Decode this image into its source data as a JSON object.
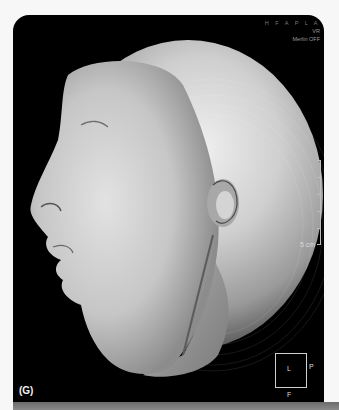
{
  "figure": {
    "panel_label": "(G)"
  },
  "overlay": {
    "top_right_line1": "H F A P L A",
    "top_right_line2": "VR",
    "top_right_line3": "Merlin OFF"
  },
  "scale": {
    "label": "5 cm"
  },
  "orientation": {
    "center": "L",
    "right": "P",
    "bottom": "F"
  },
  "colors": {
    "background": "#000000",
    "surface": "#d9d9d9",
    "page": "#f7f7f7"
  }
}
